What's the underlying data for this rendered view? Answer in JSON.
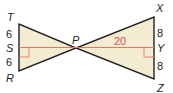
{
  "diagram": {
    "type": "geometry-two-triangles",
    "colors": {
      "fill": "#f3ecd2",
      "stroke": "#231f20",
      "altitude": "#e07a5f",
      "accent_text": "#d9534f"
    },
    "points": {
      "T": {
        "label": "T"
      },
      "S": {
        "label": "S"
      },
      "R": {
        "label": "R"
      },
      "P": {
        "label": "P"
      },
      "X": {
        "label": "X"
      },
      "Y": {
        "label": "Y"
      },
      "Z": {
        "label": "Z"
      }
    },
    "measures": {
      "TS": "6",
      "SR": "6",
      "XY": "8",
      "YZ": "8",
      "PY": "20"
    }
  }
}
